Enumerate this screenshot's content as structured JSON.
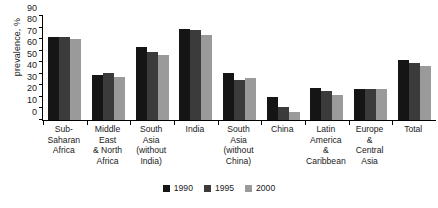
{
  "chart_data": {
    "type": "bar",
    "title": "",
    "xlabel": "",
    "ylabel": "prevalence, %",
    "ylim": [
      0,
      90
    ],
    "yticks": [
      0,
      10,
      20,
      30,
      40,
      50,
      60,
      70,
      80,
      90
    ],
    "grid": false,
    "legend_position": "bottom",
    "categories": [
      "Sub-Saharan Africa",
      "Middle East & North Africa",
      "South Asia (without India)",
      "India",
      "South Asia (without China)",
      "China",
      "Latin America & Caribbean",
      "Europe & Central Asia",
      "Total"
    ],
    "category_lines": [
      [
        "Sub-Saharan",
        "Africa"
      ],
      [
        "Middle East",
        "& North",
        "Africa"
      ],
      [
        "South",
        "Asia",
        "(without",
        "India)"
      ],
      [
        "India"
      ],
      [
        "South",
        "Asia",
        "(without",
        "China)"
      ],
      [
        "China"
      ],
      [
        "Latin",
        "America",
        "&",
        "Caribbean"
      ],
      [
        "Europe",
        "&",
        "Central",
        "Asia"
      ],
      [
        "Total"
      ]
    ],
    "series": [
      {
        "name": "1990",
        "color": "#151515",
        "values": [
          72,
          39,
          63,
          79,
          41,
          20,
          28,
          27,
          52
        ]
      },
      {
        "name": "1995",
        "color": "#3b3b3b",
        "values": [
          72,
          41,
          59,
          78,
          35,
          11,
          25,
          27,
          49
        ]
      },
      {
        "name": "2000",
        "color": "#9a9a9a",
        "values": [
          70,
          37,
          56,
          74,
          36,
          7,
          22,
          27,
          47
        ]
      }
    ]
  },
  "legend": {
    "items": [
      {
        "label": "1990"
      },
      {
        "label": "1995"
      },
      {
        "label": "2000"
      }
    ]
  }
}
